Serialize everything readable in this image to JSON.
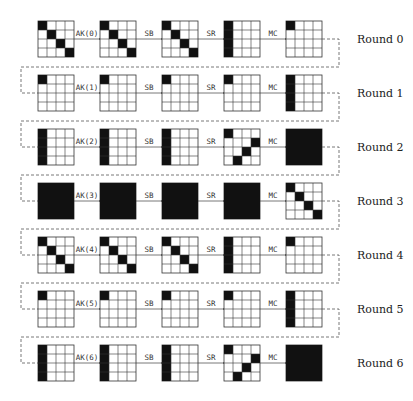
{
  "diagram": {
    "colors": {
      "active": "#111111",
      "inactive": "#ffffff",
      "grid": "#333333",
      "line": "#555555"
    },
    "layout": {
      "grid_x": [
        38,
        100,
        162,
        224,
        286
      ],
      "row_y0": 21,
      "row_step": 54,
      "cell": 9
    },
    "rounds": [
      {
        "label": "Round 0",
        "ops": [
          "AK(0)",
          "SB",
          "SR",
          "MC"
        ],
        "states": [
          [
            [
              0,
              0
            ],
            [
              1,
              1
            ],
            [
              2,
              2
            ],
            [
              3,
              3
            ]
          ],
          [
            [
              0,
              0
            ],
            [
              1,
              1
            ],
            [
              2,
              2
            ],
            [
              3,
              3
            ]
          ],
          [
            [
              0,
              0
            ],
            [
              1,
              1
            ],
            [
              2,
              2
            ],
            [
              3,
              3
            ]
          ],
          [
            [
              0,
              0
            ],
            [
              1,
              0
            ],
            [
              2,
              0
            ],
            [
              3,
              0
            ]
          ],
          [
            [
              0,
              0
            ]
          ]
        ]
      },
      {
        "label": "Round 1",
        "ops": [
          "AK(1)",
          "SB",
          "SR",
          "MC"
        ],
        "states": [
          [
            [
              0,
              0
            ]
          ],
          [
            [
              0,
              0
            ]
          ],
          [
            [
              0,
              0
            ]
          ],
          [
            [
              0,
              0
            ]
          ],
          [
            [
              0,
              0
            ],
            [
              1,
              0
            ],
            [
              2,
              0
            ],
            [
              3,
              0
            ]
          ]
        ]
      },
      {
        "label": "Round 2",
        "ops": [
          "AK(2)",
          "SB",
          "SR",
          "MC"
        ],
        "states": [
          [
            [
              0,
              0
            ],
            [
              1,
              0
            ],
            [
              2,
              0
            ],
            [
              3,
              0
            ]
          ],
          [
            [
              0,
              0
            ],
            [
              1,
              0
            ],
            [
              2,
              0
            ],
            [
              3,
              0
            ]
          ],
          [
            [
              0,
              0
            ],
            [
              1,
              0
            ],
            [
              2,
              0
            ],
            [
              3,
              0
            ]
          ],
          [
            [
              0,
              0
            ],
            [
              1,
              3
            ],
            [
              2,
              2
            ],
            [
              3,
              1
            ]
          ],
          "full"
        ]
      },
      {
        "label": "Round 3",
        "ops": [
          "AK(3)",
          "SB",
          "SR",
          "MC"
        ],
        "states": [
          "full",
          "full",
          "full",
          "full",
          [
            [
              0,
              0
            ],
            [
              1,
              1
            ],
            [
              2,
              2
            ],
            [
              3,
              3
            ]
          ]
        ]
      },
      {
        "label": "Round 4",
        "ops": [
          "AK(4)",
          "SB",
          "SR",
          "MC"
        ],
        "states": [
          [
            [
              0,
              0
            ],
            [
              1,
              1
            ],
            [
              2,
              2
            ],
            [
              3,
              3
            ]
          ],
          [
            [
              0,
              0
            ],
            [
              1,
              1
            ],
            [
              2,
              2
            ],
            [
              3,
              3
            ]
          ],
          [
            [
              0,
              0
            ],
            [
              1,
              1
            ],
            [
              2,
              2
            ],
            [
              3,
              3
            ]
          ],
          [
            [
              0,
              0
            ],
            [
              1,
              0
            ],
            [
              2,
              0
            ],
            [
              3,
              0
            ]
          ],
          [
            [
              0,
              0
            ]
          ]
        ]
      },
      {
        "label": "Round 5",
        "ops": [
          "AK(5)",
          "SB",
          "SR",
          "MC"
        ],
        "states": [
          [
            [
              0,
              0
            ]
          ],
          [
            [
              0,
              0
            ]
          ],
          [
            [
              0,
              0
            ]
          ],
          [
            [
              0,
              0
            ]
          ],
          [
            [
              0,
              0
            ],
            [
              1,
              0
            ],
            [
              2,
              0
            ],
            [
              3,
              0
            ]
          ]
        ]
      },
      {
        "label": "Round 6",
        "ops": [
          "AK(6)",
          "SB",
          "SR",
          "MC"
        ],
        "states": [
          [
            [
              0,
              0
            ],
            [
              1,
              0
            ],
            [
              2,
              0
            ],
            [
              3,
              0
            ]
          ],
          [
            [
              0,
              0
            ],
            [
              1,
              0
            ],
            [
              2,
              0
            ],
            [
              3,
              0
            ]
          ],
          [
            [
              0,
              0
            ],
            [
              1,
              0
            ],
            [
              2,
              0
            ],
            [
              3,
              0
            ]
          ],
          [
            [
              0,
              0
            ],
            [
              1,
              3
            ],
            [
              2,
              2
            ],
            [
              3,
              1
            ]
          ],
          "full"
        ]
      }
    ]
  }
}
